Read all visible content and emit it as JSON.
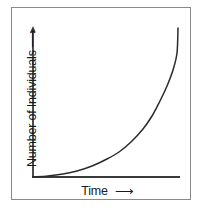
{
  "chart_data": {
    "type": "line",
    "title": "",
    "subtitle": "",
    "xlabel": "Time",
    "ylabel": "Number of Individuals",
    "xlabel_arrow": "⟶",
    "ylabel_arrow": "⟶",
    "grid": false,
    "legend": null,
    "axis_ticks": false,
    "tick_labels": [],
    "annotations": [],
    "curve_name": "exponential-growth-curve",
    "curve_color": "#2b2b2b",
    "axis_color": "#3a3a3a",
    "frame_color": "#8a8a8a",
    "background_color": "#ffffff",
    "xlim": [
      0,
      1
    ],
    "ylim": [
      0,
      1
    ],
    "x": [
      0.0,
      0.1,
      0.2,
      0.3,
      0.4,
      0.5,
      0.58,
      0.66,
      0.74,
      0.8,
      0.85,
      0.9,
      0.94,
      0.97,
      1.0
    ],
    "y": [
      0.005,
      0.012,
      0.025,
      0.045,
      0.075,
      0.12,
      0.165,
      0.23,
      0.32,
      0.405,
      0.495,
      0.61,
      0.72,
      0.83,
      1.0
    ],
    "points_px": [
      [
        33,
        177
      ],
      [
        48,
        176
      ],
      [
        63,
        174
      ],
      [
        77,
        171
      ],
      [
        92,
        166
      ],
      [
        107,
        159
      ],
      [
        119,
        152
      ],
      [
        131,
        142
      ],
      [
        143,
        129
      ],
      [
        152,
        116
      ],
      [
        159,
        103
      ],
      [
        167,
        86
      ],
      [
        173,
        70
      ],
      [
        177,
        53
      ],
      [
        178,
        28
      ]
    ]
  },
  "axes": {
    "y_axis_name": "y-axis-line",
    "x_axis_name": "x-axis-line",
    "y_axis_arrowhead": "up-arrowhead",
    "x_axis_origin_px": [
      33,
      177
    ],
    "y_axis_top_px": [
      33,
      27
    ],
    "x_axis_end_px": [
      180,
      177
    ]
  },
  "frame": {
    "name": "figure-border"
  }
}
